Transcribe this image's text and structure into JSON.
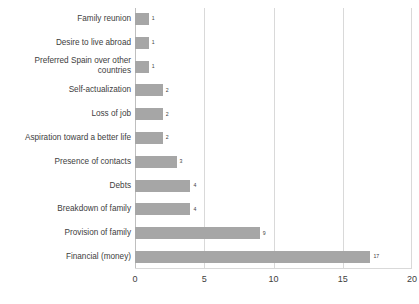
{
  "chart_data": {
    "type": "bar",
    "orientation": "horizontal",
    "title": "",
    "subtitle": "",
    "xlabel": "",
    "ylabel": "",
    "xlim": [
      0,
      20
    ],
    "xticks": [
      "0",
      "5",
      "10",
      "15",
      "20"
    ],
    "grid": "vertical",
    "legend": "none",
    "bar_color": "#a6a6a6",
    "gridline_color": "#d9d9d9",
    "categories": [
      "Family reunion",
      "Desire to live abroad",
      "Preferred Spain over other\ncountries",
      "Self-actualization",
      "Loss of job",
      "Aspiration toward a better life",
      "Presence of contacts",
      "Debts",
      "Breakdown of family",
      "Provision of family",
      "Financial (money)"
    ],
    "values": [
      1,
      1,
      1,
      2,
      2,
      2,
      3,
      4,
      4,
      9,
      17
    ],
    "data_labels": [
      "1",
      "1",
      "1",
      "2",
      "2",
      "2",
      "3",
      "4",
      "4",
      "9",
      "17"
    ]
  }
}
